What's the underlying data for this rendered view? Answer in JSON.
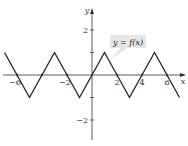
{
  "chart_data": {
    "type": "line",
    "title": "",
    "xlabel": "x",
    "ylabel": "y",
    "function_label": "y = f(x)",
    "xlim": [
      -7.3,
      7.4
    ],
    "ylim": [
      -3.0,
      3.0
    ],
    "x_ticks": [
      -6,
      -4,
      -2,
      2,
      4,
      6
    ],
    "x_tick_labels": [
      "-6",
      "",
      "-2",
      "2",
      "4",
      "6"
    ],
    "y_ticks": [
      -2,
      -1,
      1,
      2
    ],
    "y_tick_labels": [
      "-2",
      "",
      "",
      "2"
    ],
    "grid": false,
    "series": [
      {
        "name": "f(x)",
        "x": [
          -7,
          -5,
          -3,
          -1,
          1,
          3,
          5,
          7
        ],
        "y": [
          1,
          -1,
          1,
          -1,
          1,
          -1,
          1,
          -1
        ]
      }
    ],
    "colors": {
      "curve": "#222222",
      "axes": "#333333",
      "label_box": "#e6e6e6"
    }
  }
}
